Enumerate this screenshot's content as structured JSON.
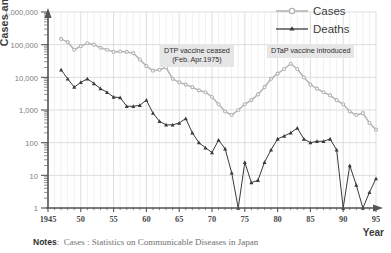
{
  "chart_data": {
    "type": "line",
    "title": "",
    "xlabel": "Year",
    "ylabel": "Cases and deaths",
    "yscale": "log",
    "ylim": [
      1,
      1000000
    ],
    "xlim": [
      1945,
      1995
    ],
    "grid": true,
    "legend_position": "top-right",
    "ytick_labels": [
      "1,000,000",
      "100,000",
      "10,000",
      "1,000",
      "100",
      "10",
      "1"
    ],
    "ytick_values": [
      1000000,
      100000,
      10000,
      1000,
      100,
      10,
      1
    ],
    "xtick_labels": [
      "1945",
      "50",
      "55",
      "60",
      "65",
      "70",
      "75",
      "80",
      "85",
      "90",
      "95"
    ],
    "xtick_values": [
      1945,
      1950,
      1955,
      1960,
      1965,
      1970,
      1975,
      1980,
      1985,
      1990,
      1995
    ],
    "series": [
      {
        "name": "Cases",
        "color": "#b4b4b4",
        "marker": "circle",
        "x": [
          1947,
          1948,
          1949,
          1950,
          1951,
          1952,
          1953,
          1954,
          1955,
          1956,
          1957,
          1958,
          1959,
          1960,
          1961,
          1962,
          1963,
          1964,
          1965,
          1966,
          1967,
          1968,
          1969,
          1970,
          1971,
          1972,
          1973,
          1974,
          1975,
          1976,
          1977,
          1978,
          1979,
          1980,
          1981,
          1982,
          1983,
          1984,
          1985,
          1986,
          1987,
          1988,
          1989,
          1990,
          1991,
          1992,
          1993,
          1994,
          1995
        ],
        "values": [
          150000,
          120000,
          70000,
          90000,
          110000,
          100000,
          80000,
          70000,
          60000,
          62000,
          60000,
          55000,
          35000,
          22000,
          16000,
          17000,
          20000,
          9000,
          7000,
          6000,
          5000,
          4000,
          3500,
          2500,
          1500,
          900,
          700,
          1000,
          1500,
          2000,
          3000,
          5000,
          9000,
          13000,
          18000,
          26000,
          18000,
          10000,
          6000,
          4500,
          3500,
          2800,
          2000,
          1500,
          900,
          700,
          800,
          400,
          250
        ]
      },
      {
        "name": "Deaths",
        "color": "#3a3a3a",
        "marker": "triangle",
        "x": [
          1947,
          1948,
          1949,
          1950,
          1951,
          1952,
          1953,
          1954,
          1955,
          1956,
          1957,
          1958,
          1959,
          1960,
          1961,
          1962,
          1963,
          1964,
          1965,
          1966,
          1967,
          1968,
          1969,
          1970,
          1971,
          1972,
          1973,
          1974,
          1975,
          1976,
          1977,
          1978,
          1979,
          1980,
          1981,
          1982,
          1983,
          1984,
          1985,
          1986,
          1987,
          1988,
          1989,
          1990,
          1991,
          1992,
          1993,
          1994,
          1995
        ],
        "values": [
          17000,
          9000,
          5000,
          7000,
          9000,
          6500,
          4500,
          3500,
          2500,
          2400,
          1300,
          1300,
          1400,
          2000,
          800,
          450,
          350,
          350,
          400,
          550,
          200,
          100,
          70,
          50,
          120,
          65,
          12,
          1,
          25,
          6,
          7,
          25,
          60,
          130,
          160,
          200,
          280,
          130,
          100,
          110,
          110,
          130,
          60,
          1,
          20,
          5,
          1,
          3,
          8
        ]
      }
    ],
    "annotations": [
      {
        "id": "dtp",
        "text_line1": "DTP vaccine ceased",
        "text_line2": "(Feb. Apr.1975)"
      },
      {
        "id": "dtap",
        "text_line1": "DTaP vaccine introduced",
        "text_line2": ""
      }
    ]
  },
  "legend": {
    "items": [
      {
        "label": "Cases"
      },
      {
        "label": "Deaths"
      }
    ]
  },
  "notes": {
    "label": "Notes",
    "text": "Cases : Statistics on Communicable Diseases in Japan"
  },
  "colors": {
    "cases": "#b4b4b4",
    "deaths": "#3a3a3a",
    "grid": "#d9d9d9",
    "axis": "#555555",
    "annotation_bg": "#e6e6e6"
  }
}
